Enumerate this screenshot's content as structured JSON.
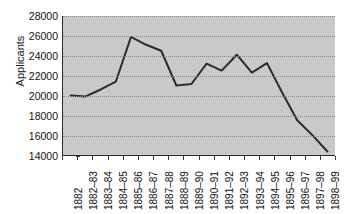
{
  "chart_data": {
    "type": "line",
    "title": "",
    "subtitle": "",
    "xlabel": "",
    "ylabel": "Applicants",
    "ylim": [
      14000,
      28000
    ],
    "ytick_step": 2000,
    "yticks": [
      14000,
      16000,
      18000,
      20000,
      22000,
      24000,
      26000,
      28000
    ],
    "ytick_labels": [
      "14000",
      "16000",
      "18000",
      "20000",
      "22000",
      "24000",
      "26000",
      "28000"
    ],
    "grid": true,
    "grid_style": "dotted-horizontal",
    "legend": false,
    "legend_position": "none",
    "categories": [
      "1882",
      "1882–83",
      "1883–84",
      "1884–85",
      "1885–86",
      "1886–87",
      "1887–88",
      "1888–89",
      "1889–90",
      "1890–91",
      "1891–92",
      "1892–93",
      "1893–94",
      "1894–95",
      "1895–96",
      "1896–97",
      "1897–98",
      "1898–99"
    ],
    "values": [
      20000,
      19900,
      20600,
      21400,
      25900,
      25100,
      24500,
      21000,
      21150,
      23200,
      22500,
      24100,
      22300,
      23250,
      20300,
      17500,
      16000,
      14350
    ],
    "series": [
      {
        "name": "Applicants",
        "values": [
          20000,
          19900,
          20600,
          21400,
          25900,
          25100,
          24500,
          21000,
          21150,
          23200,
          22500,
          24100,
          22300,
          23250,
          20300,
          17500,
          16000,
          14350
        ],
        "color": "#2b2b2b",
        "line_width": 2,
        "markers": false
      }
    ]
  },
  "style": {
    "plot_background": "#c9c9c9",
    "page_background": "#ffffff",
    "axis_color": "#2b2b2b",
    "grid_color": "#8a8a8a",
    "text_color": "#111111",
    "line_color": "#2b2b2b"
  }
}
